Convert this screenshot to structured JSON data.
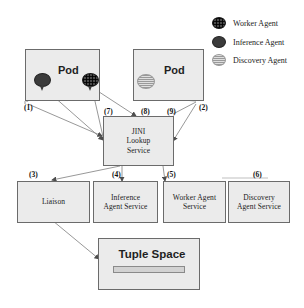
{
  "diagram": {
    "legend": [
      {
        "id": "worker",
        "label": "Worker Agent",
        "icon": "worker-agent-icon",
        "color": "#4a4a4a"
      },
      {
        "id": "inference",
        "label": "Inference Agent",
        "icon": "inference-agent-icon",
        "color": "#3b3b3b"
      },
      {
        "id": "discovery",
        "label": "Discovery Agent",
        "icon": "discovery-agent-icon",
        "color": "#dedede"
      }
    ],
    "pods": [
      {
        "id": "pod-left",
        "label": "Pod",
        "agents": [
          "inference",
          "worker"
        ]
      },
      {
        "id": "pod-right",
        "label": "Pod",
        "agents": [
          "discovery"
        ]
      }
    ],
    "nodes": {
      "jini": {
        "label": "JINI\nLookup\nService",
        "line1": "JINI",
        "line2": "Lookup",
        "line3": "Service"
      },
      "liaison": {
        "label": "Liaison"
      },
      "inference_service": {
        "line1": "Inference",
        "line2": "Agent Service"
      },
      "worker_service": {
        "line1": "Worker Agent",
        "line2": "Service"
      },
      "discovery_service": {
        "line1": "Discovery",
        "line2": "Agent Service"
      },
      "tuple_space": {
        "label": "Tuple Space"
      }
    },
    "steps": [
      {
        "id": "1",
        "label": "(1)"
      },
      {
        "id": "2",
        "label": "(2)"
      },
      {
        "id": "3",
        "label": "(3)"
      },
      {
        "id": "4",
        "label": "(4)"
      },
      {
        "id": "5",
        "label": "(5)"
      },
      {
        "id": "6",
        "label": "(6)"
      },
      {
        "id": "7",
        "label": "(7)"
      },
      {
        "id": "8",
        "label": "(8)"
      },
      {
        "id": "9",
        "label": "(9)"
      }
    ],
    "colors": {
      "box_fill": "#ebebeb",
      "box_border": "#6b6b6b",
      "line": "#8c8c8c",
      "text": "#1a1a1a",
      "background": "#ffffff"
    }
  }
}
